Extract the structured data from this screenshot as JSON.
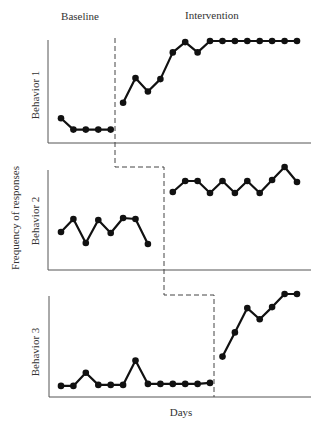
{
  "chart_data": {
    "type": "line",
    "title": "",
    "phase_labels": [
      "Baseline",
      "Intervention"
    ],
    "xlabel": "Days",
    "ylabel": "Frequency of responses",
    "x": [
      1,
      2,
      3,
      4,
      5,
      6,
      7,
      8,
      9,
      10,
      11,
      12,
      13,
      14,
      15,
      16,
      17,
      18,
      19,
      20
    ],
    "ylim": [
      0,
      10
    ],
    "grid": false,
    "legend": "none",
    "design": "multiple-baseline across behaviors",
    "panels": [
      {
        "label": "Behavior 1",
        "baseline_days": [
          1,
          2,
          3,
          4,
          5
        ],
        "intervention_days": [
          6,
          7,
          8,
          9,
          10,
          11,
          12,
          13,
          14,
          15,
          16,
          17,
          18,
          19,
          20
        ],
        "phase_change_after_day": 5,
        "baseline_values": [
          2.4,
          1.3,
          1.3,
          1.3,
          1.3
        ],
        "intervention_values": [
          3.9,
          6.3,
          5.0,
          6.2,
          8.8,
          9.8,
          8.8,
          9.9,
          9.9,
          9.9,
          9.9,
          9.9,
          9.9,
          9.9,
          9.9
        ]
      },
      {
        "label": "Behavior 2",
        "baseline_days": [
          1,
          2,
          3,
          4,
          5,
          6,
          7,
          8
        ],
        "intervention_days": [
          10,
          11,
          12,
          13,
          14,
          15,
          16,
          17,
          18,
          19,
          20
        ],
        "phase_change_after_day": 9,
        "baseline_values": [
          3.8,
          5.1,
          2.7,
          5.0,
          3.7,
          5.2,
          5.1,
          2.6
        ],
        "intervention_values": [
          7.8,
          8.9,
          8.9,
          7.7,
          8.9,
          7.7,
          8.9,
          7.7,
          9.0,
          10.3,
          8.8
        ]
      },
      {
        "label": "Behavior 3",
        "baseline_days": [
          1,
          2,
          3,
          4,
          5,
          6,
          7,
          8,
          9,
          10,
          11,
          12,
          13
        ],
        "intervention_days": [
          14,
          15,
          16,
          17,
          18,
          19,
          20
        ],
        "phase_change_after_day": 13,
        "baseline_values": [
          1.1,
          1.1,
          2.4,
          1.2,
          1.2,
          1.2,
          3.6,
          1.3,
          1.3,
          1.3,
          1.3,
          1.3,
          1.4
        ],
        "intervention_values": [
          4.0,
          6.4,
          8.8,
          7.7,
          8.9,
          10.2,
          10.2
        ]
      }
    ]
  }
}
